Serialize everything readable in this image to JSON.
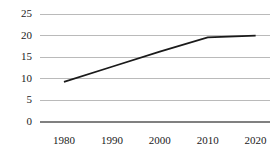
{
  "chart_data": {
    "type": "line",
    "title": "",
    "subtitle": "",
    "xlabel": "",
    "ylabel": "",
    "x": [
      1980,
      1990,
      2000,
      2010,
      2020
    ],
    "series": [
      {
        "name": "",
        "values": [
          9.3,
          12.8,
          16.3,
          19.6,
          20.0
        ]
      }
    ],
    "xticks": [
      "1980",
      "1990",
      "2000",
      "2010",
      "2020"
    ],
    "yticks": [
      "0",
      "5",
      "10",
      "15",
      "20",
      "25"
    ],
    "xlim": [
      1975,
      2023
    ],
    "ylim": [
      0,
      25
    ],
    "grid": "horizontal",
    "legend": "none",
    "line_color": "#1a1a1a",
    "grid_color": "#b3b3b3",
    "axis_color": "#808080",
    "background": "#ffffff"
  },
  "axes": {
    "y_tick_values": [
      {
        "label": "25",
        "value": 25
      },
      {
        "label": "20",
        "value": 20
      },
      {
        "label": "15",
        "value": 15
      },
      {
        "label": "10",
        "value": 10
      },
      {
        "label": "5",
        "value": 5
      },
      {
        "label": "0",
        "value": 0
      }
    ],
    "x_tick_values": [
      {
        "label": "1980",
        "value": 1980
      },
      {
        "label": "1990",
        "value": 1990
      },
      {
        "label": "2000",
        "value": 2000
      },
      {
        "label": "2010",
        "value": 2010
      },
      {
        "label": "2020",
        "value": 2020
      }
    ]
  }
}
